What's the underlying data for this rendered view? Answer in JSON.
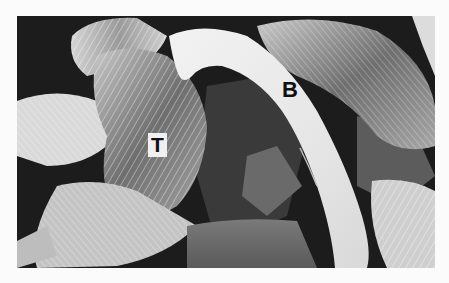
{
  "figure": {
    "labels": [
      {
        "id": "T",
        "text": "T"
      },
      {
        "id": "B",
        "text": "B"
      }
    ],
    "colors": {
      "background": "#1c1c1c",
      "highlight": "#eeeeee",
      "page": "#fbfbfb"
    }
  }
}
